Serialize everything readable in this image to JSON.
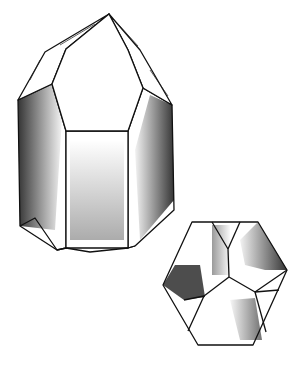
{
  "illustration": {
    "subject": "quartz crystal drawing",
    "parts": [
      "crystal-prism",
      "hexagonal-cross-section"
    ],
    "colors": {
      "ink": "#111111",
      "paper": "#ffffff"
    }
  }
}
